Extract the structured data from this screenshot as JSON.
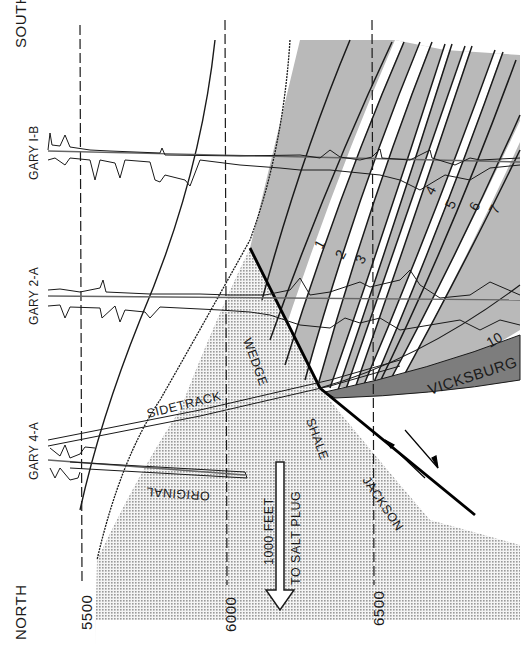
{
  "figure": {
    "orientation_labels": {
      "top": "SOUTH",
      "bottom": "NORTH"
    },
    "depth_ticks": [
      "5500",
      "6000",
      "6500"
    ],
    "wells": [
      {
        "id": "gary-1b",
        "label": "GARY I-B"
      },
      {
        "id": "gary-2a",
        "label": "GARY 2-A"
      },
      {
        "id": "gary-4a",
        "label": "GARY 4-A"
      }
    ],
    "borehole_labels": {
      "sidetrack": "SIDETRACK",
      "original": "ORIGINAL"
    },
    "formations": {
      "wedge": "WEDGE",
      "shale": "SHALE",
      "jackson": "JACKSON",
      "vicksburg": "VICKSBURG"
    },
    "sand_numbers": [
      "1",
      "2",
      "3",
      "4",
      "5",
      "6",
      "7",
      "10"
    ],
    "arrow_label": {
      "line1": "1000 FEET",
      "line2": "TO SALT PLUG"
    },
    "colors": {
      "sand_band": "#b9b9b9",
      "vicksburg": "#7d7d7d",
      "shale_stipple": "#c8c8c8",
      "ink": "#1a1a1a"
    }
  }
}
